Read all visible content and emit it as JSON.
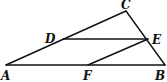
{
  "figure": {
    "points": {
      "A": {
        "x": 6,
        "y": 65
      },
      "B": {
        "x": 165,
        "y": 65
      },
      "C": {
        "x": 126,
        "y": 11
      },
      "D": {
        "x": 63,
        "y": 39
      },
      "E": {
        "x": 148,
        "y": 39
      },
      "F": {
        "x": 88,
        "y": 65
      }
    },
    "segments": [
      {
        "from": "A",
        "to": "B"
      },
      {
        "from": "A",
        "to": "C"
      },
      {
        "from": "C",
        "to": "B"
      },
      {
        "from": "D",
        "to": "E"
      },
      {
        "from": "F",
        "to": "E"
      }
    ],
    "labels": {
      "A": "A",
      "B": "B",
      "C": "C",
      "D": "D",
      "E": "E",
      "F": "F"
    },
    "line_color": "#111111"
  }
}
